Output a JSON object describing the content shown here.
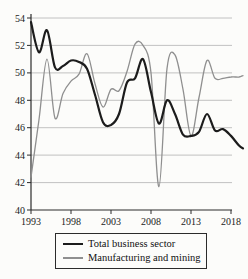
{
  "chart_data": {
    "type": "line",
    "title": "",
    "xlabel": "",
    "ylabel": "",
    "x": [
      1993,
      1994,
      1995,
      1996,
      1997,
      1998,
      1999,
      2000,
      2001,
      2002,
      2003,
      2004,
      2005,
      2006,
      2007,
      2008,
      2009,
      2010,
      2011,
      2012,
      2013,
      2014,
      2015,
      2016,
      2017,
      2018,
      2019,
      2019.5
    ],
    "series": [
      {
        "id": "total-business-sector",
        "name": "Total business sector",
        "color": "#1c1c1c",
        "stroke_width": 2.2,
        "values": [
          53.7,
          51.5,
          53.1,
          50.4,
          50.5,
          50.9,
          50.8,
          50.3,
          48.4,
          46.4,
          46.2,
          47.0,
          49.3,
          49.6,
          51.0,
          48.6,
          46.3,
          48.0,
          47.0,
          45.5,
          45.4,
          45.7,
          47.0,
          45.8,
          45.9,
          45.4,
          44.7,
          44.5
        ]
      },
      {
        "id": "manufacturing-and-mining",
        "name": "Manufacturing and mining",
        "color": "#8f8f8f",
        "stroke_width": 1.3,
        "values": [
          42.4,
          46.6,
          51.0,
          46.7,
          48.5,
          49.4,
          49.9,
          51.4,
          49.2,
          47.5,
          48.8,
          48.7,
          50.1,
          52.1,
          52.0,
          50.0,
          41.7,
          50.3,
          51.3,
          48.8,
          45.4,
          48.2,
          50.9,
          49.6,
          49.6,
          49.7,
          49.7,
          49.8
        ]
      }
    ],
    "ylim": [
      40,
      54
    ],
    "yticks": [
      40,
      42,
      44,
      46,
      48,
      50,
      52,
      54
    ],
    "xticks": [
      1993,
      1998,
      2003,
      2008,
      2013,
      2018
    ],
    "grid": "horizontal",
    "gridline_color": "#b3b3b3",
    "axis_color": "#2a2a2a",
    "legend_position": "bottom-box"
  }
}
